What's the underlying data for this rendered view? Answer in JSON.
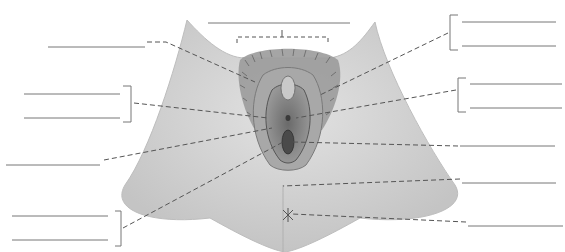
{
  "diagram": {
    "title": "",
    "blank_label_lines": [
      {
        "id": "top-center",
        "x1": 208,
        "y1": 23,
        "x2": 350,
        "y2": 23
      },
      {
        "id": "left-1",
        "x1": 48,
        "y1": 47,
        "x2": 145,
        "y2": 47
      },
      {
        "id": "left-2a",
        "x1": 24,
        "y1": 94,
        "x2": 120,
        "y2": 94
      },
      {
        "id": "left-2b",
        "x1": 24,
        "y1": 118,
        "x2": 120,
        "y2": 118
      },
      {
        "id": "left-3",
        "x1": 6,
        "y1": 165,
        "x2": 100,
        "y2": 165
      },
      {
        "id": "left-4a",
        "x1": 12,
        "y1": 216,
        "x2": 108,
        "y2": 216
      },
      {
        "id": "left-4b",
        "x1": 12,
        "y1": 240,
        "x2": 108,
        "y2": 240
      },
      {
        "id": "right-1a",
        "x1": 462,
        "y1": 22,
        "x2": 556,
        "y2": 22
      },
      {
        "id": "right-1b",
        "x1": 462,
        "y1": 46,
        "x2": 556,
        "y2": 46
      },
      {
        "id": "right-2a",
        "x1": 470,
        "y1": 84,
        "x2": 562,
        "y2": 84
      },
      {
        "id": "right-2b",
        "x1": 470,
        "y1": 108,
        "x2": 562,
        "y2": 108
      },
      {
        "id": "right-3",
        "x1": 460,
        "y1": 146,
        "x2": 555,
        "y2": 146
      },
      {
        "id": "right-4",
        "x1": 462,
        "y1": 183,
        "x2": 556,
        "y2": 183
      },
      {
        "id": "right-5",
        "x1": 468,
        "y1": 226,
        "x2": 563,
        "y2": 226
      }
    ],
    "colors": {
      "skin": "#d6d6d6",
      "skin_dark": "#b8b8b8",
      "inner": "#8e8e8e",
      "inner_dark": "#5c5c5c",
      "hair": "#4a4a4a",
      "line": "#555555"
    }
  }
}
